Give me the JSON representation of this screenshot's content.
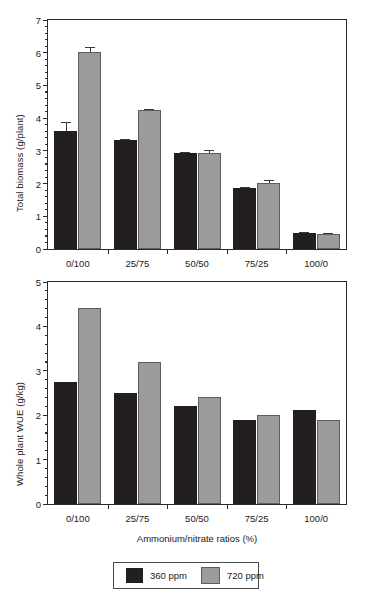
{
  "chart_data": [
    {
      "type": "bar",
      "panel": "top",
      "title": "",
      "xlabel": "",
      "ylabel": "Total biomass (g/plant)",
      "categories": [
        "0/100",
        "25/75",
        "50/50",
        "75/25",
        "100/0"
      ],
      "ylim": [
        0,
        7
      ],
      "yticks": [
        0,
        1,
        2,
        3,
        4,
        5,
        6,
        7
      ],
      "ytick_labels": [
        "0",
        "1",
        "2",
        "3",
        "4",
        "5",
        "6",
        "7"
      ],
      "minor_ticks_per_interval": 4,
      "grid": false,
      "legend_position": "below-figure",
      "series": [
        {
          "name": "360 ppm",
          "color": "#231f20",
          "values": [
            3.61,
            3.32,
            2.92,
            1.86,
            0.48
          ],
          "errors": [
            0.27,
            0.05,
            0.04,
            0.05,
            0.03
          ]
        },
        {
          "name": "720 ppm",
          "color": "#9b9b9b",
          "values": [
            6.03,
            4.24,
            2.92,
            2.02,
            0.46
          ],
          "errors": [
            0.13,
            0.04,
            0.11,
            0.09,
            0.02
          ]
        }
      ]
    },
    {
      "type": "bar",
      "panel": "bottom",
      "title": "",
      "xlabel": "Ammonium/nitrate ratios (%)",
      "ylabel": "Whole plant WUE (g/kg)",
      "categories": [
        "0/100",
        "25/75",
        "50/50",
        "75/25",
        "100/0"
      ],
      "ylim": [
        0,
        5
      ],
      "yticks": [
        0,
        1,
        2,
        3,
        4,
        5
      ],
      "ytick_labels": [
        "0",
        "1",
        "2",
        "3",
        "4",
        "5"
      ],
      "minor_ticks_per_interval": 4,
      "grid": false,
      "legend_position": "below-figure",
      "series": [
        {
          "name": "360 ppm",
          "color": "#231f20",
          "values": [
            2.74,
            2.5,
            2.2,
            1.9,
            2.11
          ],
          "errors": [
            0,
            0,
            0,
            0,
            0
          ]
        },
        {
          "name": "720 ppm",
          "color": "#9b9b9b",
          "values": [
            4.41,
            3.2,
            2.4,
            2.0,
            1.9
          ],
          "errors": [
            0,
            0,
            0,
            0,
            0
          ]
        }
      ]
    }
  ],
  "legend": {
    "entries": [
      {
        "label": "360 ppm",
        "color": "#231f20"
      },
      {
        "label": "720 ppm",
        "color": "#9b9b9b"
      }
    ]
  }
}
